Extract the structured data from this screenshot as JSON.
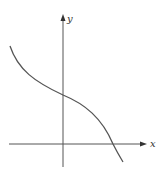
{
  "figure": {
    "type": "function-graph",
    "axes": {
      "x_label": "x",
      "y_label": "y"
    },
    "colors": {
      "axis": "#555555",
      "curve": "#555555",
      "background": "#ffffff"
    }
  }
}
